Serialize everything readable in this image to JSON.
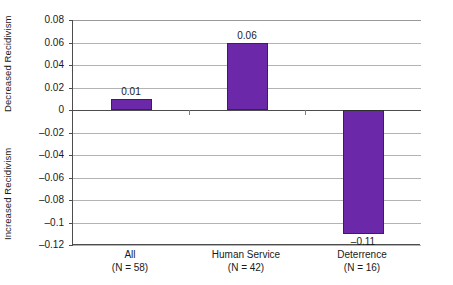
{
  "chart_data": {
    "type": "bar",
    "title": "",
    "xlabel": "",
    "ylabel_positive": "Decreased Recidivism",
    "ylabel_negative": "Increased Recidivism",
    "categories": [
      "All",
      "Human Service",
      "Deterrence"
    ],
    "category_sublabels": [
      "(N = 58)",
      "(N = 42)",
      "(N = 16)"
    ],
    "values": [
      0.01,
      0.06,
      -0.11
    ],
    "value_labels": [
      "0.01",
      "0.06",
      "–0.11"
    ],
    "ylim": [
      -0.12,
      0.08
    ],
    "ytick_values": [
      0.08,
      0.06,
      0.04,
      0.02,
      0,
      -0.02,
      -0.04,
      -0.06,
      -0.08,
      -0.1,
      -0.12
    ],
    "ytick_labels": [
      "0.08",
      "0.06",
      "0.04",
      "0.02",
      "0",
      "–0.02",
      "–0.04",
      "–0.06",
      "–0.08",
      "–0.1",
      "–0.12"
    ],
    "grid": true,
    "legend": "none",
    "bar_color": "#6B28A8",
    "bar_border_color": "#2e2e2e",
    "gridline_color": "#b3b3b3",
    "axis_color": "#4d4d4d",
    "background_color": "#ffffff"
  }
}
